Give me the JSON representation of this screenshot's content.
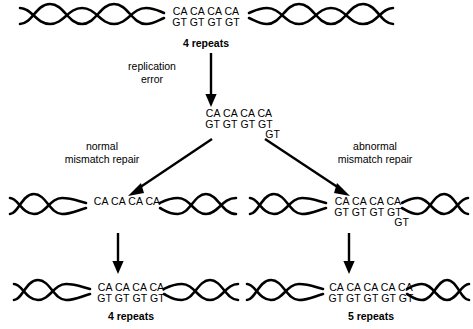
{
  "figure": {
    "type": "biology-pathway-diagram",
    "background_color": "#ffffff",
    "ink_color": "#000000"
  },
  "nodes": {
    "original": {
      "id": "original-allele",
      "top_strand": "CA CA CA CA",
      "bottom_strand": "GT GT GT GT",
      "extra_strand": "",
      "caption": "4 repeats"
    },
    "slipped": {
      "id": "replication-slippage-intermediate",
      "top_strand": "CA CA CA CA",
      "bottom_strand": "GT GT GT GT",
      "extra_strand": "GT",
      "caption": ""
    },
    "normal_repaired": {
      "id": "normal-repair-intermediate",
      "top_strand": "CA CA CA CA",
      "bottom_strand": "",
      "extra_strand": "",
      "caption": ""
    },
    "abnormal_repaired": {
      "id": "abnormal-repair-intermediate",
      "top_strand": "CA CA CA CA",
      "bottom_strand": "GT GT GT GT",
      "extra_strand": "GT",
      "caption": ""
    },
    "result_left": {
      "id": "result-unchanged-allele",
      "top_strand": "CA CA CA CA",
      "bottom_strand": "GT GT GT GT",
      "extra_strand": "",
      "caption": "4 repeats"
    },
    "result_right": {
      "id": "result-expanded-allele",
      "top_strand": "CA CA CA CA CA",
      "bottom_strand": "GT GT GT GT GT",
      "extra_strand": "",
      "caption": "5 repeats"
    }
  },
  "arrows": {
    "replication_error": {
      "label_line1": "replication",
      "label_line2": "error",
      "direction": "down"
    },
    "normal_repair": {
      "label_line1": "normal",
      "label_line2": "mismatch repair",
      "direction": "down-left"
    },
    "abnormal_repair": {
      "label_line1": "abnormal",
      "label_line2": "mismatch repair",
      "direction": "down-right"
    },
    "left_continue": {
      "label_line1": "",
      "label_line2": "",
      "direction": "down"
    },
    "right_continue": {
      "label_line1": "",
      "label_line2": "",
      "direction": "down"
    }
  }
}
